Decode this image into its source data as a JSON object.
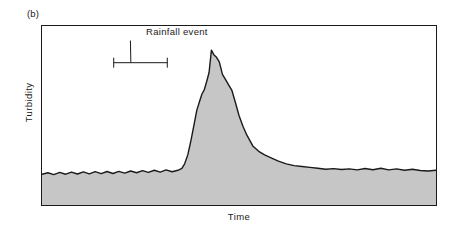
{
  "figure": {
    "panel_label": "(b)",
    "annotation_label": "Rainfall event",
    "colors": {
      "fill": "#c6c6c6",
      "line": "#1a1a1a",
      "frame": "#1a1a1a",
      "background": "#ffffff"
    }
  },
  "chart_data": {
    "type": "area",
    "title": "",
    "subtitle": "",
    "panel": "(b)",
    "xlabel": "Time",
    "ylabel": "Turbidity",
    "grid": false,
    "legend": null,
    "axis_ticks": {
      "x": [],
      "y": []
    },
    "xlim": [
      0,
      100
    ],
    "ylim": [
      0,
      100
    ],
    "annotations": [
      {
        "text": "Rainfall event",
        "type": "duration-bar-with-leader",
        "bar_x_start": 18.2,
        "bar_x_end": 31.8,
        "bar_y": 79.5,
        "text_x": 26.5,
        "text_y": 93.0
      }
    ],
    "series": [
      {
        "name": "Turbidity",
        "fill": true,
        "baseline_level": 17.5,
        "peak_level": 87.5,
        "peak_x": 43.0,
        "x": [
          0,
          1.5,
          3,
          4.5,
          6,
          7.5,
          9,
          10.5,
          12,
          13.5,
          15,
          16.5,
          18,
          19.5,
          21,
          22.5,
          24,
          25.5,
          27,
          28.5,
          30,
          31.5,
          33,
          34.5,
          35.5,
          36.2,
          37,
          37.8,
          38.6,
          39.3,
          40,
          40.6,
          41.2,
          41.8,
          42.4,
          43,
          43.6,
          44.3,
          45,
          45.8,
          46.6,
          47.4,
          48.2,
          49,
          50,
          51,
          52,
          53.5,
          55,
          56.5,
          58,
          60,
          62,
          64,
          66,
          68,
          70,
          72,
          74,
          76,
          78,
          80,
          82,
          84,
          86,
          88,
          90,
          92,
          94,
          96,
          98,
          100
        ],
        "y": [
          17.2,
          18.0,
          17.0,
          18.2,
          17.2,
          18.4,
          17.3,
          18.5,
          17.4,
          18.6,
          17.5,
          18.7,
          17.6,
          18.8,
          17.8,
          19.0,
          18.0,
          19.2,
          18.2,
          19.4,
          18.4,
          19.6,
          18.6,
          19.4,
          20.5,
          23.0,
          28.0,
          36.0,
          45.0,
          53.0,
          58.0,
          62.0,
          64.5,
          69.0,
          74.0,
          86.5,
          84.0,
          82.5,
          80.0,
          73.0,
          70.0,
          67.0,
          64.0,
          58.0,
          50.0,
          44.0,
          39.0,
          33.0,
          30.0,
          28.0,
          26.5,
          24.5,
          23.0,
          22.0,
          21.5,
          21.0,
          20.5,
          20.0,
          20.3,
          19.8,
          20.2,
          19.6,
          20.4,
          19.7,
          20.5,
          19.6,
          20.2,
          19.4,
          20.0,
          19.3,
          19.0,
          19.4
        ]
      }
    ]
  }
}
